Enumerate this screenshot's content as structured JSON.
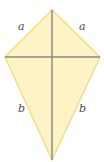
{
  "diagram": {
    "shape": "kite",
    "colors": {
      "fill": "#fdf3c4",
      "edge": "#f3dc8a",
      "diagonal": "#8a8a80",
      "label": "#4a4a4a"
    },
    "vertices": {
      "top": [
        52,
        10
      ],
      "left": [
        5,
        57
      ],
      "right": [
        100,
        57
      ],
      "bottom": [
        52,
        160
      ]
    },
    "labels": {
      "upper_left": "a",
      "upper_right": "a",
      "lower_left": "b",
      "lower_right": "b"
    }
  }
}
